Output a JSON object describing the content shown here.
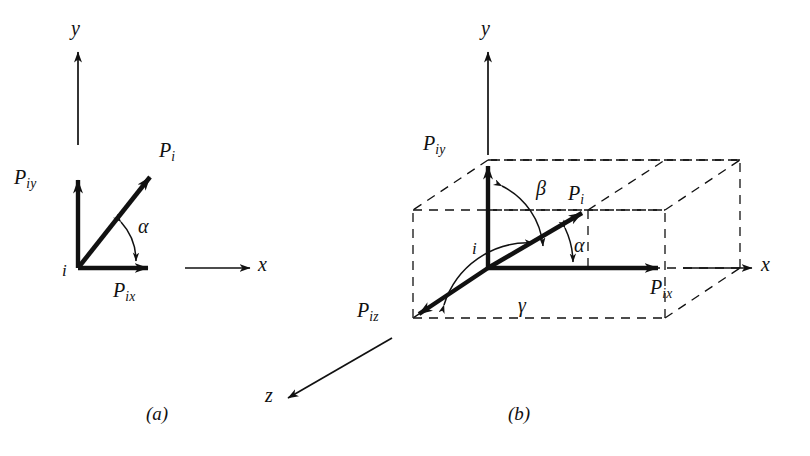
{
  "figure": {
    "kind": "vector-decomposition-diagram",
    "background_color": "#ffffff",
    "stroke_color": "#111111",
    "panels": [
      {
        "id": "a",
        "caption": "(a)",
        "description": "Two-dimensional resolution of force P-sub-i into x and y components"
      },
      {
        "id": "b",
        "caption": "(b)",
        "description": "Three-dimensional resolution of force P-sub-i into x, y and z components inside a dashed reference box"
      }
    ]
  },
  "panel_a": {
    "caption": "(a)",
    "axes": [
      {
        "name": "y-axis",
        "label": "y",
        "label_base": "y",
        "label_sub": ""
      },
      {
        "name": "x-axis",
        "label": "x",
        "label_base": "x",
        "label_sub": ""
      }
    ],
    "origin_label": "i",
    "vectors": [
      {
        "name": "resultant",
        "label_base": "P",
        "label_sub": "i"
      },
      {
        "name": "y-component",
        "label_base": "P",
        "label_sub": "iy"
      },
      {
        "name": "x-component",
        "label_base": "P",
        "label_sub": "ix"
      }
    ],
    "angles": [
      {
        "name": "alpha",
        "glyph": "α",
        "between": "resultant and x-axis"
      }
    ]
  },
  "panel_b": {
    "caption": "(b)",
    "axes": [
      {
        "name": "y-axis",
        "label": "y",
        "label_base": "y",
        "label_sub": ""
      },
      {
        "name": "x-axis",
        "label": "x",
        "label_base": "x",
        "label_sub": ""
      },
      {
        "name": "z-axis",
        "label": "z",
        "label_base": "z",
        "label_sub": ""
      }
    ],
    "origin_label": "i",
    "vectors": [
      {
        "name": "resultant",
        "label_base": "P",
        "label_sub": "i"
      },
      {
        "name": "y-component",
        "label_base": "P",
        "label_sub": "iy"
      },
      {
        "name": "x-component",
        "label_base": "P",
        "label_sub": "ix"
      },
      {
        "name": "z-component",
        "label_base": "P",
        "label_sub": "iz"
      }
    ],
    "angles": [
      {
        "name": "alpha",
        "glyph": "α",
        "between": "resultant and x-axis"
      },
      {
        "name": "beta",
        "glyph": "β",
        "between": "resultant and y-axis"
      },
      {
        "name": "gamma",
        "glyph": "γ",
        "between": "resultant and z-axis"
      }
    ]
  },
  "labels": {
    "a_y_axis": "y",
    "a_x_axis": "x",
    "a_origin": "i",
    "a_alpha": "α",
    "a_caption": "(a)",
    "b_y_axis": "y",
    "b_x_axis": "x",
    "b_z_axis": "z",
    "b_origin": "i",
    "b_alpha": "α",
    "b_beta": "β",
    "b_gamma": "γ",
    "b_caption": "(b)",
    "P": "P",
    "sub_i": "i",
    "sub_ix": "ix",
    "sub_iy": "iy",
    "sub_iz": "iz"
  }
}
